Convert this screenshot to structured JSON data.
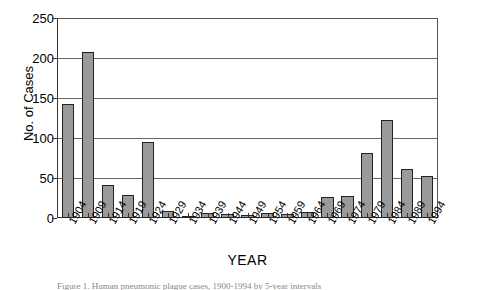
{
  "chart_data": {
    "type": "bar",
    "title": "",
    "xlabel": "YEAR",
    "ylabel": "No. of Cases",
    "ylim": [
      0,
      250
    ],
    "ytick_values": [
      250,
      200,
      150,
      100,
      50,
      0
    ],
    "ytick_labels": [
      "250",
      "200",
      "150",
      "100",
      "50",
      "0"
    ],
    "grid": "horizontal",
    "legend": "none",
    "bar_color": "#9a9a9a",
    "bar_edge_color": "#222222",
    "categories": [
      "1904",
      "1909",
      "1914",
      "1919",
      "1924",
      "1929",
      "1934",
      "1939",
      "1944",
      "1949",
      "1954",
      "1959",
      "1964",
      "1969",
      "1974",
      "1979",
      "1984",
      "1989",
      "1994"
    ],
    "values": [
      143,
      208,
      41,
      29,
      95,
      9,
      2,
      6,
      5,
      4,
      6,
      5,
      7,
      26,
      28,
      81,
      123,
      61,
      53
    ]
  },
  "caption": {
    "text": "Figure 1. Human pneumonic plague cases, 1900-1994 by 5-year intervals"
  }
}
